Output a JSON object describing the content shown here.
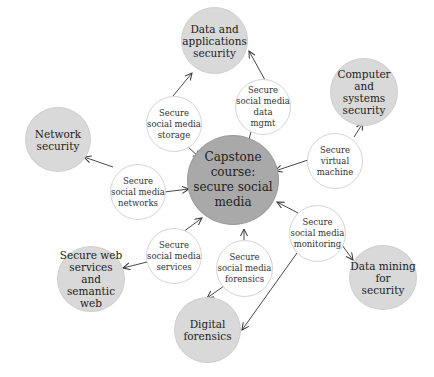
{
  "diagram": {
    "center": {
      "label": "Capstone course:\nsecure social media",
      "color": "#a9a9a9"
    },
    "outer_nodes": [
      {
        "id": "data-apps-security",
        "label": "Data and\napplications\nsecurity"
      },
      {
        "id": "computer-systems-security",
        "label": "Computer\nand\nsystems\nsecurity"
      },
      {
        "id": "network-security",
        "label": "Network\nsecurity"
      },
      {
        "id": "secure-web-services",
        "label": "Secure web\nservices and\nsemantic\nweb"
      },
      {
        "id": "digital-forensics",
        "label": "Digital\nforensics"
      },
      {
        "id": "data-mining-security",
        "label": "Data mining\nfor\nsecurity"
      }
    ],
    "inner_nodes": [
      {
        "id": "storage",
        "label": "Secure\nsocial media\nstorage"
      },
      {
        "id": "data-mgmt",
        "label": "Secure\nsocial media\ndata\nmgmt"
      },
      {
        "id": "virtual-machine",
        "label": "Secure\nvirtual\nmachine"
      },
      {
        "id": "networks",
        "label": "Secure\nsocial media\nnetworks"
      },
      {
        "id": "services",
        "label": "Secure\nsocial media\nservices"
      },
      {
        "id": "forensics",
        "label": "Secure\nsocial media\nforensics"
      },
      {
        "id": "monitoring",
        "label": "Secure\nsocial media\nmonitoring"
      }
    ],
    "colors": {
      "center_fill": "#a9a9a9",
      "outer_fill": "#d9d9d9",
      "inner_fill": "#ffffff",
      "edge": "#333333"
    },
    "edges": [
      {
        "from": "storage",
        "to": "data-apps-security"
      },
      {
        "from": "storage",
        "to": "center"
      },
      {
        "from": "data-mgmt",
        "to": "data-apps-security"
      },
      {
        "from": "data-mgmt",
        "to": "center"
      },
      {
        "from": "virtual-machine",
        "to": "computer-systems-security"
      },
      {
        "from": "virtual-machine",
        "to": "center"
      },
      {
        "from": "networks",
        "to": "network-security"
      },
      {
        "from": "networks",
        "to": "center"
      },
      {
        "from": "services",
        "to": "secure-web-services"
      },
      {
        "from": "services",
        "to": "center"
      },
      {
        "from": "forensics",
        "to": "digital-forensics"
      },
      {
        "from": "forensics",
        "to": "center"
      },
      {
        "from": "monitoring",
        "to": "data-mining-security"
      },
      {
        "from": "monitoring",
        "to": "digital-forensics"
      },
      {
        "from": "monitoring",
        "to": "center"
      }
    ]
  }
}
